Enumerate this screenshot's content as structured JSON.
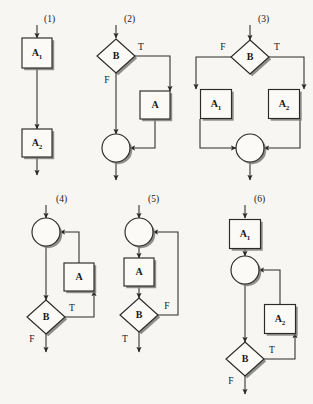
{
  "figure": {
    "background_color": "#f7f6f2",
    "ink_color": "#2a2a2a",
    "shape_fill": "#fbfaf7",
    "arrowhead_color": "#2a2a2a",
    "diagrams": [
      {
        "caption": "(1)",
        "caption_x": 44,
        "caption_y": 20,
        "pattern": "sequence",
        "entry_arrow": {
          "x": 37,
          "y1": 25,
          "y2": 38
        },
        "nodes": [
          {
            "kind": "process",
            "label": "A",
            "sub": "1",
            "cx": 37,
            "cy": 53,
            "w": 30,
            "h": 30
          },
          {
            "kind": "process",
            "label": "A",
            "sub": "2",
            "cx": 37,
            "cy": 143,
            "w": 30,
            "h": 28
          }
        ],
        "edges": [
          {
            "type": "line-arrow",
            "points": "37,68 37,129"
          },
          {
            "type": "line-arrow",
            "points": "37,157 37,175"
          }
        ],
        "branch_labels": []
      },
      {
        "caption": "(2)",
        "caption_x": 124,
        "caption_y": 20,
        "pattern": "if-then",
        "entry_arrow": {
          "x": 116,
          "y1": 25,
          "y2": 38
        },
        "nodes": [
          {
            "kind": "decision",
            "label": "B",
            "sub": "",
            "cx": 116,
            "cy": 56,
            "w": 38,
            "h": 34
          },
          {
            "kind": "process",
            "label": "A",
            "sub": "",
            "cx": 155,
            "cy": 105,
            "w": 30,
            "h": 28
          },
          {
            "kind": "merge",
            "label": "",
            "sub": "",
            "cx": 116,
            "cy": 148,
            "w": 28,
            "h": 28
          }
        ],
        "edges": [
          {
            "type": "line-arrow",
            "points": "116,73 116,134"
          },
          {
            "type": "poly-arrow",
            "points": "135,56 170,56 170,91"
          },
          {
            "type": "poly-arrow",
            "points": "155,119 155,148 130,148"
          },
          {
            "type": "line-arrow",
            "points": "116,162 116,180"
          }
        ],
        "branch_labels": [
          {
            "text": "T",
            "x": 141,
            "y": 48
          },
          {
            "text": "F",
            "x": 107,
            "y": 81
          }
        ]
      },
      {
        "caption": "(3)",
        "caption_x": 258,
        "caption_y": 20,
        "pattern": "if-then-else",
        "entry_arrow": {
          "x": 250,
          "y1": 25,
          "y2": 40
        },
        "nodes": [
          {
            "kind": "decision",
            "label": "B",
            "sub": "",
            "cx": 250,
            "cy": 57,
            "w": 38,
            "h": 34
          },
          {
            "kind": "process",
            "label": "A",
            "sub": "1",
            "cx": 216,
            "cy": 104,
            "w": 31,
            "h": 29
          },
          {
            "kind": "process",
            "label": "A",
            "sub": "2",
            "cx": 284,
            "cy": 104,
            "w": 31,
            "h": 29
          },
          {
            "kind": "merge",
            "label": "",
            "sub": "",
            "cx": 250,
            "cy": 148,
            "w": 28,
            "h": 28
          }
        ],
        "edges": [
          {
            "type": "poly-arrow",
            "points": "231,57 196,57 196,89"
          },
          {
            "type": "poly-arrow",
            "points": "269,57 304,57 304,89"
          },
          {
            "type": "poly-arrow",
            "points": "200,119 200,148 236,148"
          },
          {
            "type": "poly-arrow",
            "points": "300,119 300,148 264,148"
          },
          {
            "type": "line-arrow",
            "points": "250,162 250,180"
          }
        ],
        "branch_labels": [
          {
            "text": "F",
            "x": 223,
            "y": 48
          },
          {
            "text": "T",
            "x": 277,
            "y": 48
          }
        ]
      },
      {
        "caption": "(4)",
        "caption_x": 56,
        "caption_y": 200,
        "pattern": "repeat-until",
        "entry_arrow": {
          "x": 46,
          "y1": 205,
          "y2": 218
        },
        "nodes": [
          {
            "kind": "merge",
            "label": "",
            "sub": "",
            "cx": 46,
            "cy": 232,
            "w": 28,
            "h": 28
          },
          {
            "kind": "process",
            "label": "A",
            "sub": "",
            "cx": 79,
            "cy": 277,
            "w": 30,
            "h": 28
          },
          {
            "kind": "decision",
            "label": "B",
            "sub": "",
            "cx": 46,
            "cy": 317,
            "w": 38,
            "h": 34
          }
        ],
        "edges": [
          {
            "type": "line-arrow",
            "points": "46,246 46,300"
          },
          {
            "type": "poly-arrow",
            "points": "79,263 79,232 60,232"
          },
          {
            "type": "poly-arrow",
            "points": "65,317 94,317 94,291"
          },
          {
            "type": "line-arrow",
            "points": "46,334 46,352"
          }
        ],
        "branch_labels": [
          {
            "text": "T",
            "x": 72,
            "y": 309
          },
          {
            "text": "F",
            "x": 32,
            "y": 340
          }
        ]
      },
      {
        "caption": "(5)",
        "caption_x": 148,
        "caption_y": 200,
        "pattern": "repeat-until-false",
        "entry_arrow": {
          "x": 139,
          "y1": 205,
          "y2": 218
        },
        "nodes": [
          {
            "kind": "merge",
            "label": "",
            "sub": "",
            "cx": 139,
            "cy": 232,
            "w": 28,
            "h": 28
          },
          {
            "kind": "process",
            "label": "A",
            "sub": "",
            "cx": 139,
            "cy": 272,
            "w": 30,
            "h": 28
          },
          {
            "kind": "decision",
            "label": "B",
            "sub": "",
            "cx": 139,
            "cy": 315,
            "w": 38,
            "h": 34
          }
        ],
        "edges": [
          {
            "type": "line-arrow",
            "points": "139,246 139,258"
          },
          {
            "type": "line-arrow",
            "points": "139,286 139,298"
          },
          {
            "type": "poly-arrow",
            "points": "158,315 178,315 178,232 153,232"
          },
          {
            "type": "line-arrow",
            "points": "139,332 139,352"
          }
        ],
        "branch_labels": [
          {
            "text": "F",
            "x": 167,
            "y": 307
          },
          {
            "text": "T",
            "x": 125,
            "y": 340
          }
        ]
      },
      {
        "caption": "(6)",
        "caption_x": 254,
        "caption_y": 200,
        "pattern": "loop-with-prologue",
        "entry_arrow": {
          "x": 245,
          "y1": 205,
          "y2": 218
        },
        "nodes": [
          {
            "kind": "process",
            "label": "A",
            "sub": "1",
            "cx": 245,
            "cy": 234,
            "w": 31,
            "h": 29
          },
          {
            "kind": "merge",
            "label": "",
            "sub": "",
            "cx": 245,
            "cy": 270,
            "w": 28,
            "h": 28
          },
          {
            "kind": "process",
            "label": "A",
            "sub": "2",
            "cx": 280,
            "cy": 319,
            "w": 31,
            "h": 29
          },
          {
            "kind": "decision",
            "label": "B",
            "sub": "",
            "cx": 245,
            "cy": 359,
            "w": 38,
            "h": 34
          }
        ],
        "edges": [
          {
            "type": "line-arrow",
            "points": "245,249 245,256"
          },
          {
            "type": "line-arrow",
            "points": "245,284 245,342"
          },
          {
            "type": "poly-arrow",
            "points": "280,305 280,270 259,270"
          },
          {
            "type": "poly-arrow",
            "points": "264,359 295,359 295,333"
          },
          {
            "type": "line-arrow",
            "points": "245,376 245,394"
          }
        ],
        "branch_labels": [
          {
            "text": "T",
            "x": 272,
            "y": 351
          },
          {
            "text": "F",
            "x": 231,
            "y": 382
          }
        ]
      }
    ]
  }
}
